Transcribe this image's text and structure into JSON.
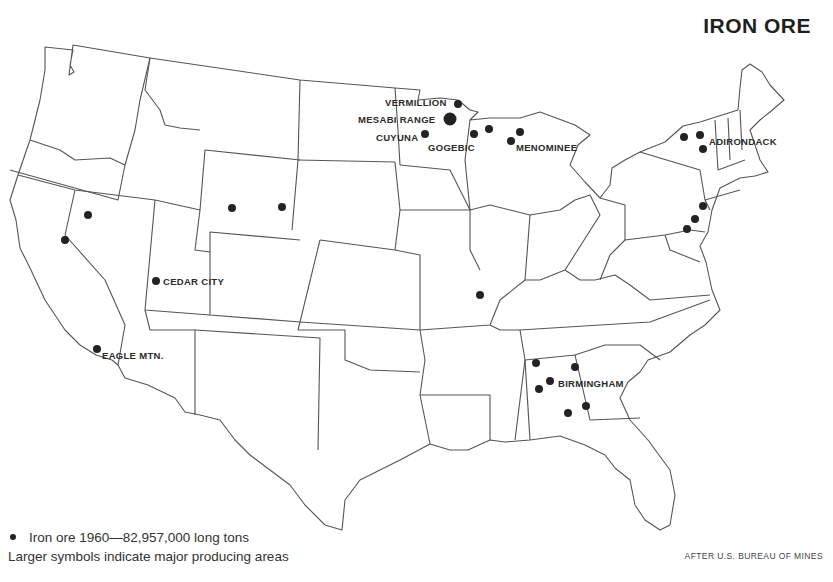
{
  "title": "IRON ORE",
  "legend": {
    "symbol_label": "Iron ore 1960—82,957,000 long tons",
    "note": "Larger symbols indicate major producing areas"
  },
  "source": "AFTER U.S. BUREAU OF MINES",
  "sites": [
    {
      "name": "VERMILLION",
      "label_x": 385,
      "label_y": 97,
      "dot_x": 458,
      "dot_y": 104,
      "size": "small"
    },
    {
      "name": "MESABI RANGE",
      "label_x": 358,
      "label_y": 114,
      "dot_x": 450,
      "dot_y": 119,
      "size": "large"
    },
    {
      "name": "CUYUNA",
      "label_x": 376,
      "label_y": 132,
      "dot_x": 425,
      "dot_y": 134,
      "size": "small"
    },
    {
      "name": "GOGEBIC",
      "label_x": 428,
      "label_y": 142,
      "dot_x": null,
      "dot_y": null,
      "size": "none"
    },
    {
      "name": "MENOMINEE",
      "label_x": 516,
      "label_y": 142,
      "dot_x": null,
      "dot_y": null,
      "size": "none"
    },
    {
      "name": "ADIRONDACK",
      "label_x": 709,
      "label_y": 136,
      "dot_x": null,
      "dot_y": null,
      "size": "none"
    },
    {
      "name": "CEDAR CITY",
      "label_x": 163,
      "label_y": 276,
      "dot_x": 156,
      "dot_y": 281,
      "size": "small"
    },
    {
      "name": "EAGLE MTN.",
      "label_x": 102,
      "label_y": 350,
      "dot_x": 97,
      "dot_y": 349,
      "size": "small"
    },
    {
      "name": "BIRMINGHAM",
      "label_x": 558,
      "label_y": 378,
      "dot_x": null,
      "dot_y": null,
      "size": "none"
    }
  ],
  "extra_dots": [
    {
      "region": "Gogebic-1",
      "x": 474,
      "y": 134
    },
    {
      "region": "Gogebic-2",
      "x": 489,
      "y": 129
    },
    {
      "region": "Menominee-1",
      "x": 511,
      "y": 141
    },
    {
      "region": "Menominee-2",
      "x": 520,
      "y": 132
    },
    {
      "region": "Adirondack-1",
      "x": 684,
      "y": 137
    },
    {
      "region": "Adirondack-2",
      "x": 700,
      "y": 135
    },
    {
      "region": "Adirondack-3",
      "x": 703,
      "y": 149
    },
    {
      "region": "Pennsylvania-1",
      "x": 703,
      "y": 206
    },
    {
      "region": "Pennsylvania-2",
      "x": 695,
      "y": 219
    },
    {
      "region": "Pennsylvania-3",
      "x": 687,
      "y": 229
    },
    {
      "region": "Wyoming-1",
      "x": 232,
      "y": 208
    },
    {
      "region": "Wyoming-2",
      "x": 282,
      "y": 207
    },
    {
      "region": "Nevada-1",
      "x": 88,
      "y": 215
    },
    {
      "region": "Nevada-2",
      "x": 65,
      "y": 240
    },
    {
      "region": "Missouri",
      "x": 480,
      "y": 295
    },
    {
      "region": "Alabama-1",
      "x": 536,
      "y": 363
    },
    {
      "region": "Alabama-2",
      "x": 550,
      "y": 381
    },
    {
      "region": "Alabama-3",
      "x": 539,
      "y": 389
    },
    {
      "region": "Alabama-4",
      "x": 575,
      "y": 367
    },
    {
      "region": "Alabama-5",
      "x": 568,
      "y": 413
    },
    {
      "region": "Georgia",
      "x": 586,
      "y": 406
    }
  ]
}
